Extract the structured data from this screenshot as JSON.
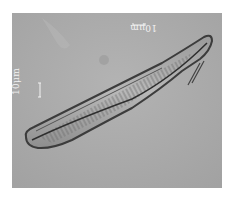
{
  "image": {
    "subject": "diatom micrograph (pennate diatom, light microscopy)",
    "background_color": "#a9a9a9",
    "border_color": "#ffffff"
  },
  "scale_bars": [
    {
      "position": "top-right",
      "label": "10μm",
      "orientation": "upside-down"
    },
    {
      "position": "left",
      "label": "10μm",
      "orientation": "rotated-vertical"
    }
  ]
}
